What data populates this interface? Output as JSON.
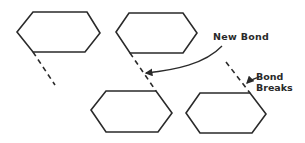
{
  "diagram": {
    "labels": {
      "new_bond": "New Bond",
      "bond_breaks_line1": "Bond",
      "bond_breaks_line2": "Breaks"
    },
    "stroke_color": "#2a2a2a",
    "background_color": "#ffffff",
    "shapes": [
      {
        "name": "hexagon-top-left",
        "points": [
          [
            17,
            32
          ],
          [
            33,
            12
          ],
          [
            87,
            12
          ],
          [
            100,
            33
          ],
          [
            85,
            52
          ],
          [
            33,
            52
          ]
        ]
      },
      {
        "name": "hexagon-top-middle",
        "points": [
          [
            116,
            32
          ],
          [
            129,
            13
          ],
          [
            183,
            13
          ],
          [
            197,
            33
          ],
          [
            183,
            53
          ],
          [
            130,
            53
          ]
        ]
      },
      {
        "name": "hexagon-bottom-middle",
        "points": [
          [
            91,
            110
          ],
          [
            106,
            91
          ],
          [
            156,
            91
          ],
          [
            172,
            113
          ],
          [
            158,
            132
          ],
          [
            106,
            132
          ]
        ]
      },
      {
        "name": "hexagon-bottom-right",
        "points": [
          [
            186,
            113
          ],
          [
            200,
            93
          ],
          [
            250,
            93
          ],
          [
            266,
            114
          ],
          [
            252,
            133
          ],
          [
            200,
            133
          ]
        ]
      }
    ],
    "dashed_bonds": [
      {
        "name": "bond-dash-top-left",
        "from": [
          33,
          52
        ],
        "to": [
          55,
          85
        ]
      },
      {
        "name": "bond-dash-new-bond",
        "from": [
          130,
          53
        ],
        "to": [
          156,
          91
        ]
      },
      {
        "name": "bond-dash-breaking",
        "from": [
          226,
          62
        ],
        "to": [
          250,
          93
        ]
      }
    ],
    "arrows": [
      {
        "name": "arrow-new-bond",
        "label": "New Bond",
        "points_to": [
          143,
          74
        ]
      },
      {
        "name": "arrow-bond-breaks",
        "label": "Bond Breaks",
        "points_to": [
          245,
          86
        ]
      }
    ]
  }
}
